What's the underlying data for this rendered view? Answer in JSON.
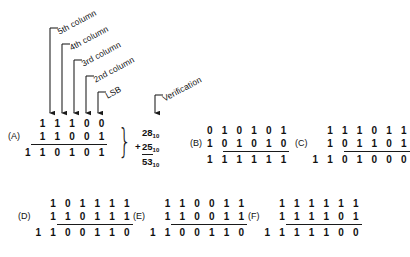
{
  "figure": {
    "background": "#ffffff",
    "ink": "#1a1a1a"
  },
  "callouts": [
    {
      "name": "5th-column",
      "label": "5th column"
    },
    {
      "name": "4th-column",
      "label": "4th column"
    },
    {
      "name": "3rd-column",
      "label": "3rd column"
    },
    {
      "name": "2nd-column",
      "label": "2nd column"
    },
    {
      "name": "lsb",
      "label": "LSB"
    },
    {
      "name": "verification",
      "label": "Verification"
    }
  ],
  "problems": {
    "a": {
      "label": "(A)",
      "addend1": "1 1 1 0 0",
      "addend2": "1 1 0 0 1",
      "sum": "1 1 0 1 0 1"
    },
    "b": {
      "label": "(B)",
      "addend1": "0 1 0 1 0 1",
      "addend2": "1 0 1 0 1 0",
      "sum": "1 1 1 1 1 1"
    },
    "c": {
      "label": "(C)",
      "addend1": "1 1 1 0 1 1",
      "addend2": "1 0 1 1 0 1",
      "sum": "1 1 0 1 0 0 0"
    },
    "d": {
      "label": "(D)",
      "addend1": "1 0 1 1 1 1",
      "addend2": "1 1 0 1 1 1",
      "sum": "1 1 0 0 1 1 0"
    },
    "e": {
      "label": "(E)",
      "addend1": "1 1 0 0 1 1",
      "addend2": "1 1 0 0 1 1",
      "sum": "1 1 0 0 1 1 0"
    },
    "f": {
      "label": "(F)",
      "addend1": "1 1 1 1 1 1",
      "addend2": "1 1 1 1 0 1",
      "sum": "1 1 1 1 1 0 0"
    }
  },
  "verification": {
    "addend1": "28",
    "addend1_base": "10",
    "plus": "+",
    "addend2": "25",
    "addend2_base": "10",
    "sum": "53",
    "sum_base": "10"
  }
}
